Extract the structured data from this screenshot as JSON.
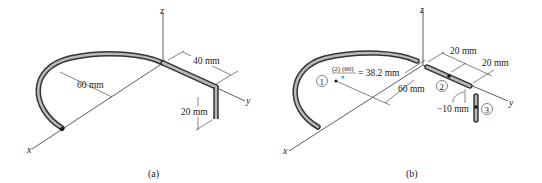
{
  "figure_a": {
    "caption": "(a)",
    "axes": {
      "x": "x",
      "y": "y",
      "z": "z"
    },
    "dims": {
      "radius": "60 mm",
      "length": "40 mm",
      "drop": "20 mm"
    }
  },
  "figure_b": {
    "caption": "(b)",
    "axes": {
      "x": "x",
      "y": "y",
      "z": "z"
    },
    "segments": {
      "s1": "1",
      "s2": "2",
      "s3": "3"
    },
    "centroid_formula": {
      "numerator": "(2) (60)",
      "denominator": "π",
      "result": "= 38.2 mm"
    },
    "dims": {
      "radius": "60 mm",
      "seg2_half": "20 mm",
      "seg2_full": "20 mm",
      "seg3_z": "−10 mm"
    }
  },
  "colors": {
    "rod": "#6e6e6e",
    "rod_highlight": "#c8c8c8",
    "line": "#333333"
  }
}
